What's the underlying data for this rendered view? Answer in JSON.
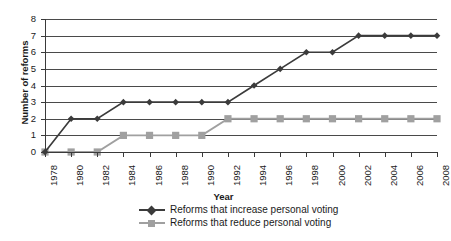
{
  "chart_data": {
    "type": "line",
    "title": "",
    "xlabel": "Year",
    "ylabel": "Number of reforms",
    "x": [
      1978,
      1980,
      1982,
      1984,
      1986,
      1988,
      1990,
      1992,
      1994,
      1996,
      1998,
      2000,
      2002,
      2004,
      2006,
      2008
    ],
    "categories": [
      "1978",
      "1980",
      "1982",
      "1984",
      "1986",
      "1988",
      "1990",
      "1992",
      "1994",
      "1996",
      "1998",
      "2000",
      "2002",
      "2004",
      "2006",
      "2008"
    ],
    "ylim": [
      0,
      8
    ],
    "yticks": [
      0,
      1,
      2,
      3,
      4,
      5,
      6,
      7,
      8
    ],
    "ytick_labels": [
      "0",
      "1",
      "2",
      "3",
      "4",
      "5",
      "6",
      "7",
      "8"
    ],
    "grid": "horizontal",
    "legend_position": "bottom",
    "series": [
      {
        "name": "Reforms that increase personal voting",
        "color": "#3b3b3b",
        "marker": "diamond",
        "values": [
          0,
          2,
          2,
          3,
          3,
          3,
          3,
          3,
          4,
          5,
          6,
          6,
          7,
          7,
          7,
          7
        ]
      },
      {
        "name": "Reforms that reduce personal voting",
        "color": "#a0a0a0",
        "marker": "square",
        "values": [
          0,
          0,
          0,
          1,
          1,
          1,
          1,
          2,
          2,
          2,
          2,
          2,
          2,
          2,
          2,
          2
        ]
      }
    ]
  },
  "colors": {
    "axis": "#3a3a3a",
    "gridline": "#4a4a4a",
    "series_increase": "#3b3b3b",
    "series_reduce": "#a0a0a0",
    "background": "#ffffff"
  }
}
